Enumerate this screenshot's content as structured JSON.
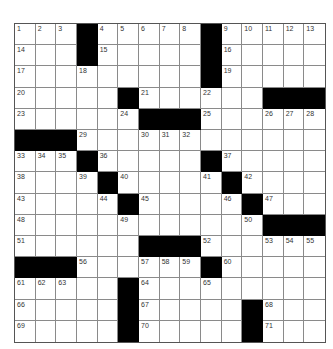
{
  "puzzle": {
    "rows": 15,
    "cols": 15,
    "colors": {
      "block": "#000000",
      "cell": "#ffffff",
      "gridline": "#8a8a8a"
    },
    "grid": [
      [
        "1",
        "2",
        "3",
        "#",
        "4",
        "5",
        "6",
        "7",
        "8",
        "#",
        "9",
        "10",
        "11",
        "12",
        "13"
      ],
      [
        "14",
        "",
        "",
        "#",
        "15",
        "",
        "",
        "",
        "",
        "#",
        "16",
        "",
        "",
        "",
        ""
      ],
      [
        "17",
        "",
        "",
        "18",
        "",
        "",
        "",
        "",
        "",
        "#",
        "19",
        "",
        "",
        "",
        ""
      ],
      [
        "20",
        "",
        "",
        "",
        "",
        "#",
        "21",
        "",
        "",
        "22",
        "",
        "",
        "#",
        "#",
        "#"
      ],
      [
        "23",
        "",
        "",
        "",
        "",
        "24",
        "#",
        "#",
        "#",
        "25",
        "",
        "",
        "26",
        "27",
        "28"
      ],
      [
        "#",
        "#",
        "#",
        "29",
        "",
        "",
        "30",
        "31",
        "32",
        "",
        "",
        "",
        "",
        "",
        ""
      ],
      [
        "33",
        "34",
        "35",
        "#",
        "36",
        "",
        "",
        "",
        "",
        "#",
        "37",
        "",
        "",
        "",
        ""
      ],
      [
        "38",
        "",
        "",
        "39",
        "#",
        "40",
        "",
        "",
        "",
        "41",
        "#",
        "42",
        "",
        "",
        ""
      ],
      [
        "43",
        "",
        "",
        "",
        "44",
        "#",
        "45",
        "",
        "",
        "",
        "46",
        "#",
        "47",
        "",
        ""
      ],
      [
        "48",
        "",
        "",
        "",
        "",
        "49",
        "",
        "",
        "",
        "",
        "",
        "50",
        "#",
        "#",
        "#"
      ],
      [
        "51",
        "",
        "",
        "",
        "",
        "",
        "#",
        "#",
        "#",
        "52",
        "",
        "",
        "53",
        "54",
        "55"
      ],
      [
        "#",
        "#",
        "#",
        "56",
        "",
        "",
        "57",
        "58",
        "59",
        "#",
        "60",
        "",
        "",
        "",
        ""
      ],
      [
        "61",
        "62",
        "63",
        "",
        "",
        "#",
        "64",
        "",
        "",
        "65",
        "",
        "",
        "",
        "",
        ""
      ],
      [
        "66",
        "",
        "",
        "",
        "",
        "#",
        "67",
        "",
        "",
        "",
        "",
        "#",
        "68",
        "",
        ""
      ],
      [
        "69",
        "",
        "",
        "",
        "",
        "#",
        "70",
        "",
        "",
        "",
        "",
        "#",
        "71",
        "",
        ""
      ]
    ]
  }
}
